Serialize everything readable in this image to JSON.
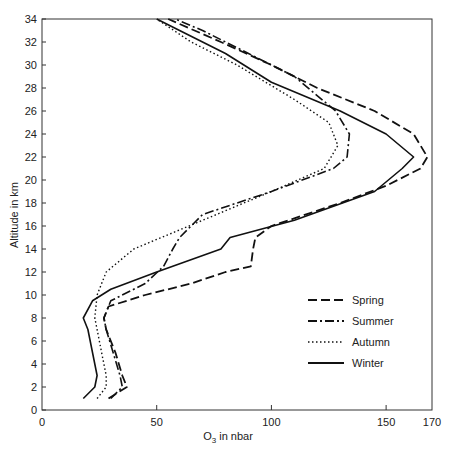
{
  "chart_data": {
    "type": "line",
    "title": "",
    "xlabel": "O3 in nbar",
    "xlabel_main": "O",
    "xlabel_sub": "3",
    "xlabel_rest": " in nbar",
    "ylabel": "Altitude in km",
    "xlim": [
      0,
      170
    ],
    "ylim": [
      0,
      34
    ],
    "x_ticks": [
      0,
      50,
      100,
      150,
      170
    ],
    "y_ticks": [
      0,
      2,
      4,
      6,
      8,
      10,
      12,
      14,
      16,
      18,
      20,
      22,
      24,
      26,
      28,
      30,
      32,
      34
    ],
    "grid": false,
    "legend_position": "lower right",
    "series": [
      {
        "name": "Spring",
        "style": "dashed",
        "points": [
          [
            29,
            1
          ],
          [
            37,
            2
          ],
          [
            35,
            3
          ],
          [
            32,
            5
          ],
          [
            28,
            7
          ],
          [
            27,
            8
          ],
          [
            29,
            9
          ],
          [
            45,
            10
          ],
          [
            65,
            11
          ],
          [
            80,
            12
          ],
          [
            91,
            12.5
          ],
          [
            92,
            14
          ],
          [
            93,
            15
          ],
          [
            100,
            16
          ],
          [
            130,
            18
          ],
          [
            150,
            19.5
          ],
          [
            165,
            21
          ],
          [
            168,
            22
          ],
          [
            162,
            24
          ],
          [
            145,
            26
          ],
          [
            120,
            28
          ],
          [
            100,
            30
          ],
          [
            78,
            32
          ],
          [
            55,
            34
          ]
        ]
      },
      {
        "name": "Summer",
        "style": "dashdot",
        "points": [
          [
            30,
            1
          ],
          [
            35,
            2
          ],
          [
            34,
            3
          ],
          [
            31,
            5
          ],
          [
            28,
            7
          ],
          [
            27,
            8
          ],
          [
            30,
            9.5
          ],
          [
            45,
            11
          ],
          [
            53,
            12.5
          ],
          [
            57,
            14
          ],
          [
            60,
            15
          ],
          [
            70,
            17
          ],
          [
            100,
            19
          ],
          [
            127,
            21
          ],
          [
            133,
            22
          ],
          [
            134,
            24
          ],
          [
            128,
            26
          ],
          [
            110,
            29
          ],
          [
            90,
            31
          ],
          [
            70,
            33
          ],
          [
            58,
            34
          ]
        ]
      },
      {
        "name": "Autumn",
        "style": "dotted",
        "points": [
          [
            24,
            1
          ],
          [
            28,
            2
          ],
          [
            28,
            3
          ],
          [
            26,
            5
          ],
          [
            24,
            7
          ],
          [
            23,
            8
          ],
          [
            24,
            10
          ],
          [
            28,
            12
          ],
          [
            40,
            14
          ],
          [
            70,
            16.5
          ],
          [
            100,
            19
          ],
          [
            123,
            21
          ],
          [
            129,
            23
          ],
          [
            125,
            25
          ],
          [
            110,
            27
          ],
          [
            85,
            30
          ],
          [
            65,
            32
          ],
          [
            50,
            34
          ]
        ]
      },
      {
        "name": "Winter",
        "style": "solid",
        "points": [
          [
            18,
            1
          ],
          [
            23,
            2
          ],
          [
            24,
            3
          ],
          [
            22,
            5
          ],
          [
            20,
            7
          ],
          [
            18,
            8
          ],
          [
            22,
            9.5
          ],
          [
            30,
            10.5
          ],
          [
            50,
            12
          ],
          [
            78,
            14
          ],
          [
            82,
            15
          ],
          [
            110,
            16.5
          ],
          [
            145,
            19
          ],
          [
            157,
            21
          ],
          [
            162,
            22
          ],
          [
            150,
            24
          ],
          [
            130,
            26
          ],
          [
            100,
            28.5
          ],
          [
            80,
            31
          ],
          [
            60,
            33
          ],
          [
            50,
            34
          ]
        ]
      }
    ]
  }
}
